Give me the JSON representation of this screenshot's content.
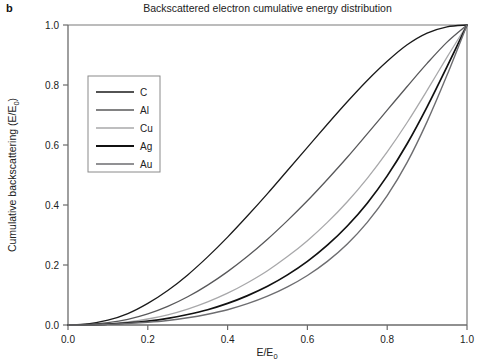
{
  "panel": {
    "label": "b"
  },
  "chart_data": {
    "type": "line",
    "title": "Backscattered electron cumulative energy distribution",
    "xlabel": "E/E0",
    "xlabel_base": "E/E",
    "xlabel_sub": "0",
    "ylabel": "Cumulative backscattering (E/E0)",
    "ylabel_base": "Cumulative backscattering (E/E",
    "ylabel_sub": "0",
    "ylabel_tail": ")",
    "xlim": [
      0.0,
      1.0
    ],
    "ylim": [
      0.0,
      1.0
    ],
    "grid": false,
    "legend_position": "upper-left-inside",
    "xticks": [
      "0.0",
      "0.2",
      "0.4",
      "0.6",
      "0.8",
      "1.0"
    ],
    "xtick_values": [
      0.0,
      0.2,
      0.4,
      0.6,
      0.8,
      1.0
    ],
    "yticks": [
      "0.0",
      "0.2",
      "0.4",
      "0.6",
      "0.8",
      "1.0"
    ],
    "ytick_values": [
      0.0,
      0.2,
      0.4,
      0.6,
      0.8,
      1.0
    ],
    "x": [
      0.0,
      0.05,
      0.1,
      0.15,
      0.2,
      0.25,
      0.3,
      0.35,
      0.4,
      0.45,
      0.5,
      0.55,
      0.6,
      0.65,
      0.7,
      0.75,
      0.8,
      0.85,
      0.9,
      0.95,
      1.0
    ],
    "series": [
      {
        "name": "C",
        "color": "#1a1a1a",
        "width": 1.3,
        "values": [
          0.0,
          0.004,
          0.016,
          0.038,
          0.072,
          0.115,
          0.167,
          0.227,
          0.293,
          0.364,
          0.438,
          0.515,
          0.592,
          0.669,
          0.744,
          0.815,
          0.879,
          0.934,
          0.973,
          0.994,
          1.0
        ]
      },
      {
        "name": "Al",
        "color": "#58585a",
        "width": 1.3,
        "values": [
          0.0,
          0.002,
          0.008,
          0.019,
          0.037,
          0.062,
          0.094,
          0.133,
          0.178,
          0.229,
          0.286,
          0.348,
          0.414,
          0.485,
          0.559,
          0.637,
          0.716,
          0.795,
          0.872,
          0.943,
          1.0
        ]
      },
      {
        "name": "Cu",
        "color": "#a8a8aa",
        "width": 1.3,
        "values": [
          0.0,
          0.001,
          0.004,
          0.01,
          0.02,
          0.034,
          0.053,
          0.077,
          0.106,
          0.141,
          0.181,
          0.228,
          0.281,
          0.342,
          0.411,
          0.489,
          0.577,
          0.675,
          0.782,
          0.893,
          1.0
        ]
      },
      {
        "name": "Ag",
        "color": "#111111",
        "width": 1.7,
        "values": [
          0.0,
          0.001,
          0.003,
          0.007,
          0.013,
          0.022,
          0.035,
          0.051,
          0.072,
          0.098,
          0.129,
          0.167,
          0.212,
          0.266,
          0.33,
          0.406,
          0.497,
          0.604,
          0.727,
          0.861,
          1.0
        ]
      },
      {
        "name": "Au",
        "color": "#6d6d70",
        "width": 1.4,
        "values": [
          0.0,
          0.0005,
          0.002,
          0.005,
          0.009,
          0.015,
          0.024,
          0.036,
          0.051,
          0.071,
          0.096,
          0.127,
          0.165,
          0.212,
          0.27,
          0.342,
          0.431,
          0.542,
          0.678,
          0.833,
          1.0
        ]
      }
    ]
  },
  "legend": {
    "entries": [
      {
        "label": "C"
      },
      {
        "label": "Al"
      },
      {
        "label": "Cu"
      },
      {
        "label": "Ag"
      },
      {
        "label": "Au"
      }
    ]
  },
  "colors": {
    "axis": "#6b6b6b",
    "text": "#222222",
    "background": "#ffffff"
  }
}
